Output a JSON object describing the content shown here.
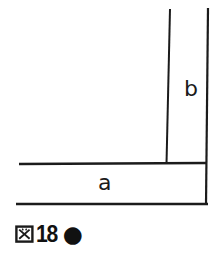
{
  "figure": {
    "background": "#ffffff",
    "line_color": "#1b1b1b",
    "strips": {
      "horizontal_label": "a",
      "vertical_label": "b"
    },
    "caption": {
      "full_text": "図18●",
      "kanji": "図",
      "number": "18",
      "bullet": "●"
    }
  }
}
